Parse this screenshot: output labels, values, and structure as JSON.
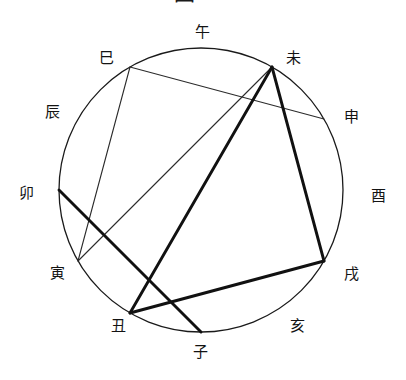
{
  "figure": {
    "title_partial": "圖 二",
    "type": "chord-diagram",
    "colors": {
      "background": "#ffffff",
      "circle_stroke": "#1a1a1a",
      "thin_line": "#2b2b2b",
      "thick_line": "#111111",
      "label_text": "#131313"
    },
    "circle": {
      "cx": 201,
      "cy": 190,
      "r": 142,
      "stroke_width": 1.3
    }
  },
  "chart_data": {
    "type": "scatter",
    "title": "圖 二",
    "xlabel": "",
    "ylabel": "",
    "grid": false,
    "legend": "none",
    "categories": [
      "子",
      "丑",
      "寅",
      "卯",
      "辰",
      "巳",
      "午",
      "未",
      "申",
      "酉",
      "戌",
      "亥"
    ],
    "values": [
      270,
      300,
      330,
      0,
      30,
      60,
      90,
      120,
      150,
      180,
      210,
      240
    ],
    "nodes": [
      {
        "id": "zi",
        "label": "子",
        "angle_deg": 270,
        "px": 201,
        "py": 332,
        "label_px": 200,
        "label_py": 352
      },
      {
        "id": "chou",
        "label": "丑",
        "angle_deg": 240,
        "px": 130,
        "py": 313,
        "label_px": 118,
        "label_py": 326
      },
      {
        "id": "yin",
        "label": "寅",
        "angle_deg": 210,
        "px": 78,
        "py": 261,
        "label_px": 57,
        "label_py": 273
      },
      {
        "id": "mao",
        "label": "卯",
        "angle_deg": 180,
        "px": 59,
        "py": 190,
        "label_px": 26,
        "label_py": 193
      },
      {
        "id": "chen",
        "label": "辰",
        "angle_deg": 150,
        "px": 78,
        "py": 119,
        "label_px": 52,
        "label_py": 112
      },
      {
        "id": "si",
        "label": "巳",
        "angle_deg": 120,
        "px": 130,
        "py": 67,
        "label_px": 106,
        "label_py": 58
      },
      {
        "id": "wu",
        "label": "午",
        "angle_deg": 90,
        "px": 201,
        "py": 48,
        "label_px": 202,
        "label_py": 32
      },
      {
        "id": "wei",
        "label": "未",
        "angle_deg": 60,
        "px": 272,
        "py": 67,
        "label_px": 293,
        "label_py": 58
      },
      {
        "id": "shen",
        "label": "申",
        "angle_deg": 30,
        "px": 324,
        "py": 119,
        "label_px": 351,
        "label_py": 117
      },
      {
        "id": "you",
        "label": "酉",
        "angle_deg": 0,
        "px": 343,
        "py": 190,
        "label_px": 378,
        "label_py": 196
      },
      {
        "id": "xu",
        "label": "戌",
        "angle_deg": 330,
        "px": 324,
        "py": 261,
        "label_px": 351,
        "label_py": 274
      },
      {
        "id": "hai",
        "label": "亥",
        "angle_deg": 300,
        "px": 272,
        "py": 313,
        "label_px": 297,
        "label_py": 326
      }
    ],
    "edges": [
      {
        "from": "si",
        "to": "shen",
        "weight": "thin",
        "width": 1.1
      },
      {
        "from": "si",
        "to": "yin",
        "weight": "thin",
        "width": 1.1
      },
      {
        "from": "wei",
        "to": "yin",
        "weight": "thin",
        "width": 1.1
      },
      {
        "from": "wei",
        "to": "chou",
        "weight": "thick",
        "width": 2.9
      },
      {
        "from": "wei",
        "to": "xu",
        "weight": "thick",
        "width": 2.9
      },
      {
        "from": "chou",
        "to": "xu",
        "weight": "thick",
        "width": 2.9
      },
      {
        "from": "mao",
        "to": "zi",
        "weight": "thick",
        "width": 2.9
      }
    ]
  }
}
